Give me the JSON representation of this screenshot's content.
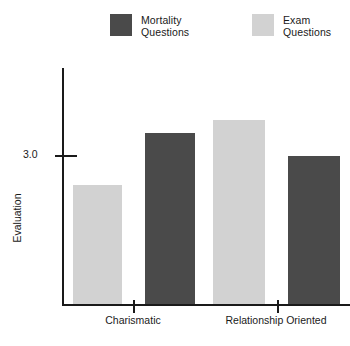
{
  "legend": {
    "position": "top",
    "items": [
      {
        "label_line1": "Mortality",
        "label_line2": "Questions",
        "color": "#4a4a4a",
        "series": "Mortality Questions"
      },
      {
        "label_line1": "Exam",
        "label_line2": "Questions",
        "color": "#d2d2d2",
        "series": "Exam Questions"
      }
    ]
  },
  "axes": {
    "ylabel": "Evaluation",
    "yticks": [
      "3.0"
    ],
    "xticklabels": [
      "Charismatic",
      "Relationship Oriented"
    ]
  },
  "chart_data": {
    "type": "bar",
    "title": "",
    "xlabel": "",
    "ylabel": "Evaluation",
    "categories": [
      "Charismatic",
      "Relationship Oriented"
    ],
    "series": [
      {
        "name": "Exam Questions",
        "color": "#d2d2d2",
        "values": [
          2.72,
          3.24
        ]
      },
      {
        "name": "Mortality Questions",
        "color": "#4a4a4a",
        "values": [
          3.15,
          3.0
        ]
      }
    ],
    "bar_order_within_group": [
      "Exam Questions",
      "Mortality Questions"
    ],
    "ytick_values": [
      3.0
    ],
    "ylim": [
      2.25,
      3.45
    ],
    "grid": false,
    "legend_position": "top"
  },
  "bars": [
    {
      "name": "charismatic-exam",
      "series": "Exam Questions",
      "category": "Charismatic",
      "value": 2.72,
      "color": "#d2d2d2",
      "x": 73,
      "width": 49,
      "top": 185
    },
    {
      "name": "charismatic-mortality",
      "series": "Mortality Questions",
      "category": "Charismatic",
      "value": 3.15,
      "color": "#4a4a4a",
      "x": 145,
      "width": 50,
      "top": 133
    },
    {
      "name": "relationship-exam",
      "series": "Exam Questions",
      "category": "Relationship Oriented",
      "value": 3.24,
      "color": "#d2d2d2",
      "x": 213,
      "width": 52,
      "top": 120
    },
    {
      "name": "relationship-mortality",
      "series": "Mortality Questions",
      "category": "Relationship Oriented",
      "value": 3.0,
      "color": "#4a4a4a",
      "x": 288,
      "width": 52,
      "top": 156
    }
  ],
  "baseline_y": 304
}
